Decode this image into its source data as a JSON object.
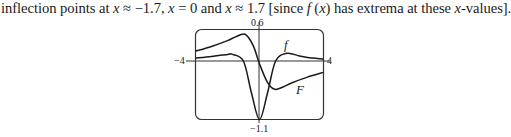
{
  "caption": {
    "prefix": "inflection points at ",
    "x1": "x",
    "approx1": " ≈ −1.7, ",
    "x2": "x",
    "eq2": " = 0 and ",
    "x3": "x",
    "approx3": " ≈ 1.7 [since ",
    "f": "f",
    "arg_open": " (",
    "x4": "x",
    "arg_close": ")",
    "suffix1": " has extrema at these ",
    "x5": "x",
    "suffix2": "-values]."
  },
  "chart_data": {
    "type": "line",
    "title": "",
    "xlabel": "",
    "ylabel": "",
    "xlim": [
      -4,
      4
    ],
    "ylim": [
      -1.1,
      0.6
    ],
    "grid": false,
    "tick_labels": {
      "x_min": "−4",
      "x_max": "4",
      "y_max": "0.6",
      "y_min": "−1.1"
    },
    "series": [
      {
        "name": "f",
        "x": [
          -4,
          -3,
          -2,
          -1.7,
          -1,
          -0.5,
          0,
          0.5,
          1,
          1.7,
          2.5,
          3,
          4
        ],
        "y": [
          0.06,
          0.09,
          0.13,
          0.13,
          0.0,
          -0.6,
          -1.1,
          -0.6,
          0.0,
          0.15,
          0.1,
          0.07,
          0.04
        ]
      },
      {
        "name": "F",
        "x": [
          -4,
          -3,
          -2,
          -1.5,
          -0.9,
          -0.4,
          0,
          0.5,
          0.95,
          1.5,
          2,
          3,
          4
        ],
        "y": [
          0.19,
          0.28,
          0.39,
          0.46,
          0.51,
          0.3,
          -0.05,
          -0.4,
          -0.53,
          -0.48,
          -0.41,
          -0.3,
          -0.21
        ]
      }
    ],
    "annotations": [
      {
        "text": "f",
        "near": "f curve right peak"
      },
      {
        "text": "F",
        "near": "F curve right tail"
      }
    ]
  },
  "labels": {
    "y_top": "0.6",
    "y_bottom": "−1.1",
    "x_left": "−4",
    "x_right": "4",
    "curve_f": "f",
    "curve_F": "F"
  }
}
